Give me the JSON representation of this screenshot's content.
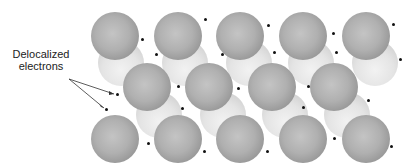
{
  "diagram": {
    "label": {
      "line1": "Delocalized",
      "line2": "electrons"
    },
    "colors": {
      "front_sphere": "#a8a8a8",
      "back_sphere": "#e2e2e2",
      "electron": "#111111",
      "text": "#222222"
    },
    "rows": [
      {
        "name": "top-row",
        "count": 5
      },
      {
        "name": "middle-row",
        "count": 4
      },
      {
        "name": "bottom-row",
        "count": 5
      }
    ]
  }
}
